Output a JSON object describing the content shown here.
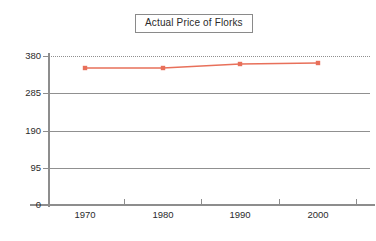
{
  "chart_data": {
    "type": "line",
    "title": "Actual Price of Florks",
    "xlabel": "",
    "ylabel": "",
    "categories": [
      "1970",
      "1980",
      "1990",
      "2000"
    ],
    "x": [
      1970,
      1980,
      1990,
      2000
    ],
    "series": [
      {
        "name": "Actual Price of Florks",
        "color": "#e8705a",
        "values": [
          351,
          351,
          361,
          363
        ]
      }
    ],
    "ylim": [
      0,
      380
    ],
    "yticks": [
      0,
      95,
      190,
      285,
      380
    ],
    "ytick_labels": [
      "0",
      "95",
      "190",
      "285",
      "380"
    ],
    "xtick_labels": [
      "1970",
      "1980",
      "1990",
      "2000"
    ],
    "grid": true,
    "gridline_styles": [
      "solid",
      "solid",
      "solid",
      "solid",
      "dotted"
    ],
    "legend": "none",
    "marker": "square",
    "axis_color": "#8d8d8d",
    "grid_color": "#909090",
    "text_color": "#2b2b2b",
    "background": "#ffffff"
  },
  "title_box": {
    "label": "Actual Price of Florks",
    "border_color": "#8a8a8a"
  },
  "axes": {
    "y_labels": [
      {
        "value": "380",
        "y": 56
      },
      {
        "value": "285",
        "y": 93
      },
      {
        "value": "190",
        "y": 131
      },
      {
        "value": "95",
        "y": 168
      },
      {
        "value": "0",
        "y": 205
      }
    ],
    "x_labels": [
      {
        "value": "1970",
        "x": 85
      },
      {
        "value": "1980",
        "x": 163
      },
      {
        "value": "1990",
        "x": 240
      },
      {
        "value": "2000",
        "x": 318
      }
    ],
    "x_ticks": [
      124,
      201,
      279,
      356
    ]
  },
  "points": [
    {
      "x": 85,
      "y": 68,
      "label": "1970"
    },
    {
      "x": 163,
      "y": 68,
      "label": "1980"
    },
    {
      "x": 240,
      "y": 64,
      "label": "1990"
    },
    {
      "x": 318,
      "y": 63,
      "label": "2000"
    }
  ]
}
